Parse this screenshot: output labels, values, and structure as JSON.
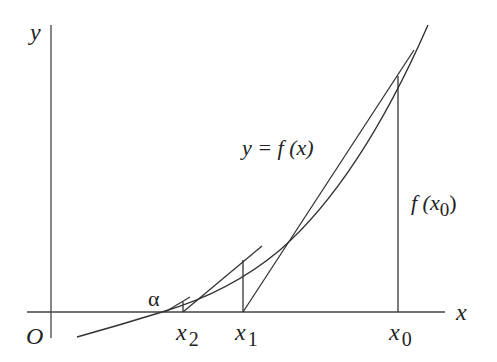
{
  "diagram": {
    "labels": {
      "y_axis": "y",
      "x_axis": "x",
      "origin": "O",
      "curve": "y = f (x)",
      "root": "α",
      "x0": "x",
      "x0_sub": "0",
      "x1": "x",
      "x1_sub": "1",
      "x2": "x",
      "x2_sub": "2",
      "fx0_pre": "f (x",
      "fx0_sub": "0",
      "fx0_post": ")"
    },
    "colors": {
      "line": "#333333",
      "text": "#222222",
      "background": "#ffffff"
    }
  }
}
